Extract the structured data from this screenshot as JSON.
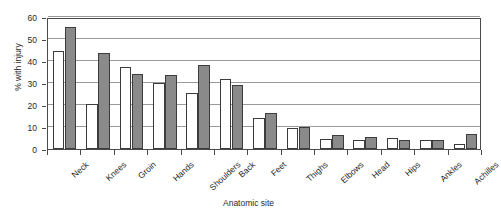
{
  "chart_data": {
    "type": "bar",
    "title": "",
    "xlabel": "Anatomic site",
    "ylabel": "% with injury",
    "ylim": [
      0,
      60
    ],
    "yticks": [
      0,
      10,
      20,
      30,
      40,
      50,
      60
    ],
    "grid": true,
    "legend": "none",
    "categories": [
      "Neck",
      "Knees",
      "Groin",
      "Hands",
      "Shoulders",
      "Back",
      "Feet",
      "Thighs",
      "Elbows",
      "Head",
      "Hips",
      "Ankles",
      "Achilles"
    ],
    "series": [
      {
        "name": "series-1",
        "color": "#ffffff",
        "values": [
          44.5,
          20.5,
          37.5,
          30.0,
          25.5,
          32.0,
          14.0,
          9.5,
          4.5,
          4.0,
          5.0,
          4.0,
          2.5
        ]
      },
      {
        "name": "series-2",
        "color": "#8a8a8a",
        "values": [
          55.5,
          43.5,
          34.0,
          33.5,
          38.0,
          29.0,
          16.5,
          10.0,
          6.5,
          5.5,
          4.0,
          4.0,
          7.0
        ]
      }
    ]
  }
}
